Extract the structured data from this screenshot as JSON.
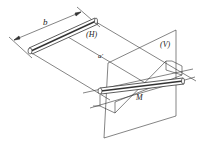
{
  "labels": {
    "dimension": "b",
    "horizontal_plane": "(H)",
    "vertical_plane": "(V)",
    "projection": "a'",
    "point": "M"
  },
  "colors": {
    "line": "#333333",
    "background": "#ffffff"
  }
}
